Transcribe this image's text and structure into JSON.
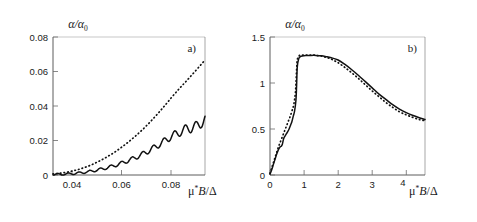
{
  "figure": {
    "panels": [
      {
        "tag": "a)",
        "ylabel": "α/α",
        "ylabel_sub": "0",
        "xlabel_mu": "μ",
        "xlabel_star": "*",
        "xlabel_b": "B",
        "xlabel_slash": "/",
        "xlabel_delta": "Δ",
        "yticks": [
          "0",
          "0.02",
          "0.04",
          "0.06",
          "0.08"
        ],
        "xticks": [
          "0.04",
          "0.06",
          "0.08"
        ]
      },
      {
        "tag": "b)",
        "ylabel": "α/α",
        "ylabel_sub": "0",
        "xlabel_mu": "μ",
        "xlabel_star": "*",
        "xlabel_b": "B",
        "xlabel_slash": "/",
        "xlabel_delta": "Δ",
        "yticks": [
          "0",
          "0.5",
          "1",
          "1.5"
        ],
        "xticks": [
          "0",
          "1",
          "2",
          "3",
          "4"
        ]
      }
    ]
  },
  "chart_data": [
    {
      "type": "line",
      "panel": "a)",
      "title": "",
      "xlabel": "μ*B/Δ",
      "ylabel": "α/α₀",
      "xlim": [
        0.032,
        0.0935
      ],
      "ylim": [
        0,
        0.088
      ],
      "xticks": [
        0.04,
        0.06,
        0.08
      ],
      "yticks": [
        0,
        0.02,
        0.04,
        0.06,
        0.08
      ],
      "grid": false,
      "legend": "none",
      "series": [
        {
          "name": "dotted",
          "style": "dotted",
          "x": [
            0.032,
            0.034,
            0.036,
            0.038,
            0.04,
            0.042,
            0.044,
            0.046,
            0.048,
            0.05,
            0.052,
            0.054,
            0.056,
            0.058,
            0.06,
            0.062,
            0.064,
            0.066,
            0.068,
            0.07,
            0.072,
            0.074,
            0.076,
            0.078,
            0.08,
            0.082,
            0.084,
            0.086,
            0.088,
            0.09,
            0.092,
            0.0935
          ],
          "y": [
            0.0007,
            0.001,
            0.0014,
            0.0019,
            0.0026,
            0.0034,
            0.0044,
            0.0055,
            0.0068,
            0.0083,
            0.0099,
            0.0117,
            0.0136,
            0.0157,
            0.018,
            0.0204,
            0.023,
            0.0257,
            0.0286,
            0.0317,
            0.035,
            0.0384,
            0.042,
            0.0457,
            0.0495,
            0.0531,
            0.0566,
            0.06,
            0.0635,
            0.067,
            0.0706,
            0.0733
          ]
        },
        {
          "name": "solid-oscillating",
          "style": "solid",
          "x": [
            0.032,
            0.034,
            0.036,
            0.038,
            0.04,
            0.042,
            0.044,
            0.046,
            0.048,
            0.05,
            0.052,
            0.054,
            0.056,
            0.058,
            0.06,
            0.062,
            0.064,
            0.066,
            0.068,
            0.07,
            0.072,
            0.074,
            0.076,
            0.078,
            0.08,
            0.082,
            0.084,
            0.086,
            0.088,
            0.09,
            0.092,
            0.0935
          ],
          "y": [
            0.0003,
            0.0004,
            0.0005,
            0.0007,
            0.0009,
            0.0012,
            0.0016,
            0.002,
            0.0026,
            0.0032,
            0.0039,
            0.0047,
            0.0056,
            0.0066,
            0.0077,
            0.0089,
            0.0102,
            0.0116,
            0.0131,
            0.0148,
            0.0166,
            0.0185,
            0.0205,
            0.0226,
            0.0248,
            0.0263,
            0.0278,
            0.0296,
            0.03,
            0.031,
            0.0335,
            0.0352
          ],
          "oscillation": {
            "amplitude_start": 0.0006,
            "amplitude_end": 0.0035,
            "period_x": 0.0043
          }
        }
      ]
    },
    {
      "type": "line",
      "panel": "b)",
      "title": "",
      "xlabel": "μ*B/Δ",
      "ylabel": "α/α₀",
      "xlim": [
        0,
        4.55
      ],
      "ylim": [
        0,
        1.56
      ],
      "xticks": [
        0,
        1,
        2,
        3,
        4
      ],
      "yticks": [
        0,
        0.5,
        1,
        1.5
      ],
      "grid": false,
      "legend": "none",
      "series": [
        {
          "name": "dotted",
          "style": "dotted",
          "x": [
            0.0,
            0.05,
            0.1,
            0.15,
            0.2,
            0.25,
            0.3,
            0.35,
            0.4,
            0.45,
            0.5,
            0.55,
            0.6,
            0.65,
            0.7,
            0.75,
            0.78,
            0.8,
            0.85,
            0.9,
            1.0,
            1.1,
            1.2,
            1.3,
            1.4,
            1.5,
            1.6,
            1.7,
            1.8,
            1.9,
            2.0,
            2.2,
            2.4,
            2.6,
            2.8,
            3.0,
            3.2,
            3.4,
            3.6,
            3.8,
            4.0,
            4.2,
            4.4,
            4.55
          ],
          "y": [
            0.02,
            0.08,
            0.14,
            0.2,
            0.26,
            0.32,
            0.37,
            0.42,
            0.47,
            0.52,
            0.57,
            0.62,
            0.67,
            0.73,
            0.8,
            0.95,
            1.18,
            1.3,
            1.345,
            1.355,
            1.355,
            1.355,
            1.355,
            1.355,
            1.35,
            1.345,
            1.335,
            1.325,
            1.31,
            1.29,
            1.27,
            1.215,
            1.155,
            1.09,
            1.02,
            0.95,
            0.885,
            0.82,
            0.765,
            0.715,
            0.68,
            0.65,
            0.625,
            0.615
          ]
        },
        {
          "name": "solid",
          "style": "solid",
          "x": [
            0.0,
            0.05,
            0.1,
            0.15,
            0.2,
            0.25,
            0.3,
            0.33,
            0.36,
            0.4,
            0.44,
            0.48,
            0.52,
            0.56,
            0.6,
            0.64,
            0.68,
            0.72,
            0.76,
            0.78,
            0.8,
            0.84,
            0.88,
            0.95,
            1.05,
            1.2,
            1.35,
            1.5,
            1.65,
            1.8,
            2.0,
            2.2,
            2.4,
            2.6,
            2.8,
            3.0,
            3.2,
            3.4,
            3.6,
            3.8,
            4.0,
            4.2,
            4.4,
            4.55
          ],
          "y": [
            0.01,
            0.06,
            0.12,
            0.18,
            0.24,
            0.29,
            0.32,
            0.325,
            0.345,
            0.41,
            0.44,
            0.465,
            0.49,
            0.52,
            0.56,
            0.6,
            0.66,
            0.72,
            0.84,
            1.0,
            1.22,
            1.31,
            1.335,
            1.345,
            1.35,
            1.352,
            1.352,
            1.348,
            1.338,
            1.325,
            1.3,
            1.25,
            1.19,
            1.125,
            1.055,
            0.985,
            0.915,
            0.855,
            0.795,
            0.745,
            0.705,
            0.672,
            0.645,
            0.628
          ]
        }
      ]
    }
  ]
}
